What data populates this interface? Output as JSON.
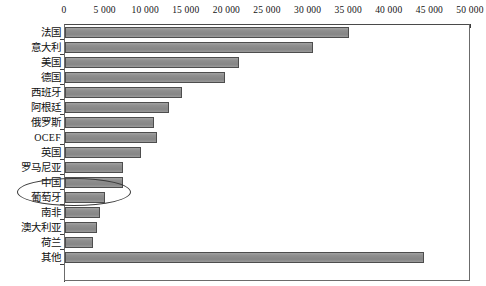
{
  "chart_data": {
    "type": "bar",
    "orientation": "horizontal",
    "title": "",
    "subtitle": "",
    "xlabel": "",
    "ylabel": "",
    "xlim": [
      0,
      50000
    ],
    "xticks": [
      0,
      5000,
      10000,
      15000,
      20000,
      25000,
      30000,
      35000,
      40000,
      45000,
      50000
    ],
    "xtick_labels": [
      "0",
      "5 000",
      "10 000",
      "15 000",
      "20 000",
      "25 000",
      "30 000",
      "35 000",
      "40 000",
      "45 000",
      "50 000"
    ],
    "grid": false,
    "legend": null,
    "categories": [
      "法国",
      "意大利",
      "美国",
      "德国",
      "西班牙",
      "阿根廷",
      "俄罗斯",
      "OCEF",
      "英国",
      "罗马尼亚",
      "中国",
      "葡萄牙",
      "南非",
      "澳大利亚",
      "荷兰",
      "其他"
    ],
    "values": [
      35000,
      30500,
      21400,
      19700,
      14400,
      12800,
      10900,
      11300,
      9400,
      7200,
      7200,
      4900,
      4300,
      3900,
      3400,
      44200
    ],
    "bar_color": "#8e8e8e",
    "bar_border_color": "#4d4d4d",
    "annotations": [
      {
        "type": "ellipse",
        "target_category": "中国",
        "name": "china-highlight-ellipse"
      }
    ]
  },
  "axis": {
    "tick_labels": [
      "0",
      "5 000",
      "10 000",
      "15 000",
      "20 000",
      "25 000",
      "30 000",
      "35 000",
      "40 000",
      "45 000",
      "50 000"
    ]
  },
  "rows": [
    {
      "label": "法国",
      "value": 35000,
      "latin": false
    },
    {
      "label": "意大利",
      "value": 30500,
      "latin": false
    },
    {
      "label": "美国",
      "value": 21400,
      "latin": false
    },
    {
      "label": "德国",
      "value": 19700,
      "latin": false
    },
    {
      "label": "西班牙",
      "value": 14400,
      "latin": false
    },
    {
      "label": "阿根廷",
      "value": 12800,
      "latin": false
    },
    {
      "label": "俄罗斯",
      "value": 10900,
      "latin": false
    },
    {
      "label": "OCEF",
      "value": 11300,
      "latin": true
    },
    {
      "label": "英国",
      "value": 9400,
      "latin": false
    },
    {
      "label": "罗马尼亚",
      "value": 7200,
      "latin": false
    },
    {
      "label": "中国",
      "value": 7200,
      "latin": false
    },
    {
      "label": "葡萄牙",
      "value": 4900,
      "latin": false
    },
    {
      "label": "南非",
      "value": 4300,
      "latin": false
    },
    {
      "label": "澳大利亚",
      "value": 3900,
      "latin": false
    },
    {
      "label": "荷兰",
      "value": 3400,
      "latin": false
    },
    {
      "label": "其他",
      "value": 44200,
      "latin": false
    }
  ]
}
